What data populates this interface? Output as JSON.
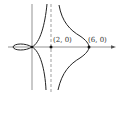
{
  "diagram": {
    "type": "curve-graph",
    "points": [
      {
        "label": "(2, 0)",
        "x": 2,
        "y": 0
      },
      {
        "label": "(6, 0)",
        "x": 6,
        "y": 0
      }
    ],
    "asymptote": {
      "type": "vertical",
      "x": 2,
      "style": "dashed"
    },
    "colors": {
      "curve": "#222222",
      "axis": "#666666",
      "asymptote": "#777777"
    }
  }
}
